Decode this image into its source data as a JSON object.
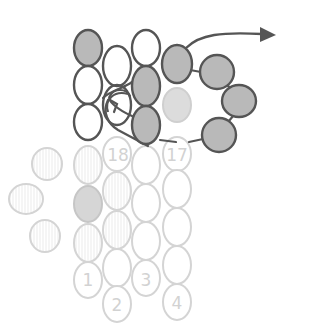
{
  "diagram": {
    "type": "beading-stitch-diagram",
    "colors": {
      "dark_outline": "#555555",
      "dark_fill_gray": "#b9b9b9",
      "dark_fill_white": "#ffffff",
      "faded_outline": "#d4d4d4",
      "faded_fill_gray": "#d8d8d8",
      "faded_fill_hatched": "#f0f0f0",
      "faded_fill_white": "#ffffff",
      "thread": "#555555",
      "arrow": "#555555"
    },
    "labels": {
      "bead_1": "1",
      "bead_2": "2",
      "bead_3": "3",
      "bead_4": "4",
      "bead_17": "17",
      "bead_18": "18"
    },
    "beads": [
      {
        "id": "c1r1",
        "cx": 88,
        "cy": 48,
        "rx": 14,
        "ry": 18,
        "style": "dark-gray"
      },
      {
        "id": "c1r2",
        "cx": 88,
        "cy": 85,
        "rx": 14,
        "ry": 19,
        "style": "dark-white"
      },
      {
        "id": "c1r3",
        "cx": 88,
        "cy": 122,
        "rx": 14,
        "ry": 18,
        "style": "dark-white"
      },
      {
        "id": "c2r1",
        "cx": 117,
        "cy": 66,
        "rx": 14,
        "ry": 20,
        "style": "dark-white"
      },
      {
        "id": "c2r2",
        "cx": 117,
        "cy": 105,
        "rx": 14,
        "ry": 20,
        "style": "dark-white"
      },
      {
        "id": "c3r1",
        "cx": 146,
        "cy": 48,
        "rx": 14,
        "ry": 18,
        "style": "dark-white"
      },
      {
        "id": "c3r2",
        "cx": 146,
        "cy": 86,
        "rx": 14,
        "ry": 20,
        "style": "dark-gray"
      },
      {
        "id": "c3r3",
        "cx": 146,
        "cy": 125,
        "rx": 14,
        "ry": 19,
        "style": "dark-gray"
      },
      {
        "id": "c4r1",
        "cx": 177,
        "cy": 64,
        "rx": 15,
        "ry": 19,
        "style": "dark-gray"
      },
      {
        "id": "c4r2",
        "cx": 177,
        "cy": 105,
        "rx": 14,
        "ry": 17,
        "style": "light-gray"
      },
      {
        "id": "p1",
        "cx": 217,
        "cy": 72,
        "rx": 17,
        "ry": 17,
        "style": "dark-gray"
      },
      {
        "id": "p2",
        "cx": 239,
        "cy": 101,
        "rx": 17,
        "ry": 16,
        "style": "dark-gray"
      },
      {
        "id": "p3",
        "cx": 219,
        "cy": 135,
        "rx": 17,
        "ry": 17,
        "style": "dark-gray"
      },
      {
        "id": "c1r4",
        "cx": 88,
        "cy": 165,
        "rx": 14,
        "ry": 19,
        "style": "faded-hatched"
      },
      {
        "id": "c1r5",
        "cx": 88,
        "cy": 204,
        "rx": 14,
        "ry": 18,
        "style": "faded-gray"
      },
      {
        "id": "c1r6",
        "cx": 88,
        "cy": 243,
        "rx": 14,
        "ry": 19,
        "style": "faded-hatched"
      },
      {
        "id": "c1r7",
        "cx": 88,
        "cy": 280,
        "rx": 14,
        "ry": 18,
        "style": "faded-white",
        "label": "bead_1"
      },
      {
        "id": "c2r3",
        "cx": 117,
        "cy": 154,
        "rx": 14,
        "ry": 17,
        "style": "faded-white",
        "label": "bead_18"
      },
      {
        "id": "c2r4",
        "cx": 117,
        "cy": 191,
        "rx": 14,
        "ry": 19,
        "style": "faded-hatched"
      },
      {
        "id": "c2r5",
        "cx": 117,
        "cy": 230,
        "rx": 14,
        "ry": 19,
        "style": "faded-hatched"
      },
      {
        "id": "c2r6",
        "cx": 117,
        "cy": 268,
        "rx": 14,
        "ry": 19,
        "style": "faded-white"
      },
      {
        "id": "c2r7",
        "cx": 117,
        "cy": 304,
        "rx": 14,
        "ry": 18,
        "style": "faded-white",
        "label": "bead_2"
      },
      {
        "id": "c3r4",
        "cx": 146,
        "cy": 165,
        "rx": 14,
        "ry": 19,
        "style": "faded-white"
      },
      {
        "id": "c3r5",
        "cx": 146,
        "cy": 203,
        "rx": 14,
        "ry": 19,
        "style": "faded-white"
      },
      {
        "id": "c3r6",
        "cx": 146,
        "cy": 241,
        "rx": 14,
        "ry": 19,
        "style": "faded-white"
      },
      {
        "id": "c3r7",
        "cx": 146,
        "cy": 278,
        "rx": 14,
        "ry": 18,
        "style": "faded-white",
        "label": "bead_3"
      },
      {
        "id": "c4r3",
        "cx": 177,
        "cy": 154,
        "rx": 14,
        "ry": 17,
        "style": "faded-white",
        "label": "bead_17"
      },
      {
        "id": "c4r4",
        "cx": 177,
        "cy": 189,
        "rx": 14,
        "ry": 19,
        "style": "faded-white"
      },
      {
        "id": "c4r5",
        "cx": 177,
        "cy": 227,
        "rx": 14,
        "ry": 19,
        "style": "faded-white"
      },
      {
        "id": "c4r6",
        "cx": 177,
        "cy": 265,
        "rx": 14,
        "ry": 19,
        "style": "faded-white"
      },
      {
        "id": "c4r7",
        "cx": 177,
        "cy": 302,
        "rx": 14,
        "ry": 18,
        "style": "faded-white",
        "label": "bead_4"
      },
      {
        "id": "l1",
        "cx": 47,
        "cy": 164,
        "rx": 15,
        "ry": 16,
        "style": "faded-hatched"
      },
      {
        "id": "l2",
        "cx": 26,
        "cy": 199,
        "rx": 17,
        "ry": 15,
        "style": "faded-hatched"
      },
      {
        "id": "l3",
        "cx": 45,
        "cy": 236,
        "rx": 15,
        "ry": 16,
        "style": "faded-hatched"
      }
    ]
  }
}
